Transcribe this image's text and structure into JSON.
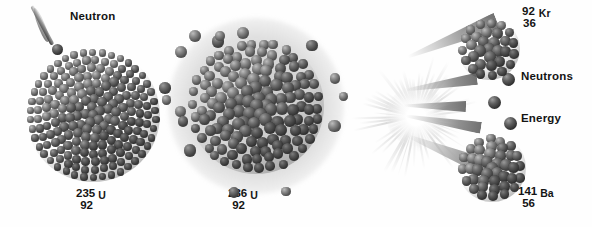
{
  "diagram": {
    "title_text": "",
    "background_color": "#fefefe"
  },
  "labels": {
    "neutron": "Neutron",
    "neutrons": "Neutrons",
    "energy": "Energy"
  },
  "isotopes": {
    "target": {
      "mass_number": "235",
      "atomic_number": "92",
      "symbol": "U"
    },
    "compound": {
      "mass_number": "236",
      "atomic_number": "92",
      "symbol": "U"
    },
    "product_top": {
      "mass_number": "92",
      "atomic_number": "36",
      "symbol": "Kr"
    },
    "product_bottom": {
      "mass_number": "141",
      "atomic_number": "56",
      "symbol": "Ba"
    }
  },
  "colors": {
    "background": "#fefefe",
    "text": "#141414",
    "nucleon_dark": "#2a2a2a",
    "nucleon_light": "#9a9a9a",
    "halo": "#a5a5a5",
    "burst_core": "#ffffff",
    "cone": "#6f6f6f"
  },
  "stages": [
    {
      "name": "absorption",
      "caption": "235 92 U"
    },
    {
      "name": "excited-compound-nucleus",
      "caption": "236 92 U"
    },
    {
      "name": "fission-products",
      "caption": "92 36 Kr and 141 56 Ba"
    }
  ]
}
